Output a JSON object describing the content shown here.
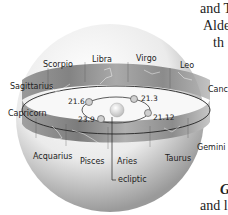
{
  "figure": {
    "type": "celestial-sphere-zodiac",
    "colors": {
      "sphere_light": "#f4f4f4",
      "sphere_shade": "#9a9a9a",
      "band_dark": "#6e6e6e",
      "band_light": "#c8c8c8",
      "ecliptic_line": "#222222",
      "sun": "#d8d8d8",
      "text": "#222222"
    },
    "constellations_back": [
      "Scorpio",
      "Libra",
      "Virgo",
      "Leo"
    ],
    "constellations_side": [
      "Sagittarius",
      "Cancer",
      "Capricorn",
      "Gemini"
    ],
    "constellations_front": [
      "Acquarius",
      "Pisces",
      "Aries",
      "Taurus"
    ],
    "labels": {
      "scorpio": "Scorpio",
      "libra": "Libra",
      "virgo": "Virgo",
      "leo": "Leo",
      "sagittarius": "Sagittarius",
      "cancer": "Canc",
      "capricorn": "Capricorn",
      "gemini": "Gemini",
      "acquarius": "Acquarius",
      "pisces": "Pisces",
      "aries": "Aries",
      "taurus": "Taurus",
      "ecliptic": "ecliptic"
    },
    "earth_positions": {
      "mar": "21.6",
      "jun": "21.3",
      "sep": "21.12",
      "dec": "23.9"
    }
  },
  "side_text": {
    "line1": "and T",
    "line2": "Alde",
    "line3": "th",
    "line4": "G",
    "line5": "and l"
  }
}
